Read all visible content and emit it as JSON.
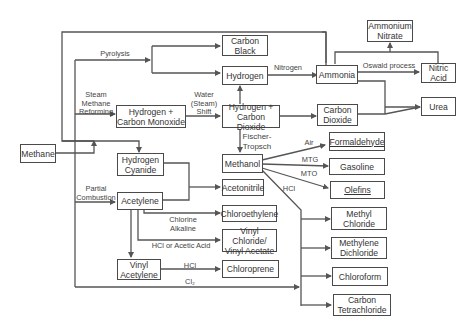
{
  "diagram": {
    "title": "",
    "nodes": {
      "methane": "Methane",
      "carbon_black": "Carbon\nBlack",
      "hydrogen": "Hydrogen",
      "h2_co": "Hydrogen +\nCarbon Monoxide",
      "h2_co2": "Hydrogen +\nCarbon Dioxide",
      "ammonia": "Ammonia",
      "ammonium_nitrate": "Ammonium\nNitrate",
      "nitric_acid": "Nitric\nAcid",
      "urea": "Urea",
      "carbon_dioxide": "Carbon\nDioxide",
      "hydrogen_cyanide": "Hydrogen\nCyanide",
      "methanol": "Methanol",
      "formaldehyde": "Formaldehyde",
      "gasoline": "Gasoline",
      "olefins": "Olefins",
      "acetonitrile": "Acetonitrile",
      "acetylene": "Acetylene",
      "chloroethylene": "Chloroethylene",
      "vinyl_chloride_acetate": "Vinyl Chloride/\nVinyl Acetate",
      "vinyl_acetylene": "Vinyl\nAcetylene",
      "chloroprene": "Chloroprene",
      "methyl_chloride": "Methyl\nChloride",
      "methylene_dichloride": "Methylene\nDichloride",
      "chloroform": "Chloroform",
      "carbon_tetrachloride": "Carbon\nTetrachloride"
    },
    "edge_labels": {
      "pyrolysis": "Pyrolysis",
      "steam_methane_reforming": "Steam\nMethane\nReforming",
      "water_steam_shift": "Water\n(Steam)\nShift",
      "nitrogen": "Nitrogen",
      "oswald_process": "Oswald process",
      "fischer_tropsch": "Fischer-\nTropsch",
      "air": "Air",
      "mtg": "MTG",
      "mto": "MTO",
      "hcl_methanol": "HCl",
      "partial_combustion": "Partial\nCombustion",
      "chlorine_alkaline": "Chlorine\nAlkaline",
      "hcl_or_acetic_acid": "HCl or Acetic Acid",
      "hcl_vinyl": "HCl",
      "cl2": "Cl₂"
    },
    "edges": [
      {
        "from": "methane",
        "to": "carbon_black",
        "label": "Pyrolysis"
      },
      {
        "from": "methane",
        "to": "hydrogen",
        "label": "Pyrolysis"
      },
      {
        "from": "methane",
        "to": "h2_co",
        "label": "Steam Methane Reforming"
      },
      {
        "from": "h2_co",
        "to": "h2_co2",
        "label": "Water (Steam) Shift"
      },
      {
        "from": "h2_co2",
        "to": "hydrogen"
      },
      {
        "from": "hydrogen",
        "to": "ammonia",
        "label": "Nitrogen"
      },
      {
        "from": "ammonia",
        "to": "nitric_acid",
        "label": "Oswald process"
      },
      {
        "from": "ammonia",
        "to": "ammonium_nitrate"
      },
      {
        "from": "nitric_acid",
        "to": "ammonium_nitrate"
      },
      {
        "from": "ammonia",
        "to": "urea"
      },
      {
        "from": "h2_co2",
        "to": "carbon_dioxide"
      },
      {
        "from": "carbon_dioxide",
        "to": "urea"
      },
      {
        "from": "ammonia",
        "to": "hydrogen_cyanide"
      },
      {
        "from": "methane",
        "to": "hydrogen_cyanide"
      },
      {
        "from": "h2_co2",
        "to": "methanol",
        "label": "Fischer-Tropsch"
      },
      {
        "from": "methanol",
        "to": "formaldehyde",
        "label": "Air"
      },
      {
        "from": "methanol",
        "to": "gasoline",
        "label": "MTG"
      },
      {
        "from": "methanol",
        "to": "olefins",
        "label": "MTO"
      },
      {
        "from": "methanol",
        "to": "methyl_chloride",
        "label": "HCl"
      },
      {
        "from": "methanol",
        "to": "methylene_dichloride",
        "label": "HCl"
      },
      {
        "from": "methanol",
        "to": "chloroform",
        "label": "HCl"
      },
      {
        "from": "methanol",
        "to": "carbon_tetrachloride",
        "label": "HCl"
      },
      {
        "from": "hydrogen_cyanide",
        "to": "acetonitrile"
      },
      {
        "from": "acetylene",
        "to": "acetonitrile"
      },
      {
        "from": "methane",
        "to": "acetylene",
        "label": "Partial Combustion"
      },
      {
        "from": "acetylene",
        "to": "chloroethylene",
        "label": "Chlorine Alkaline"
      },
      {
        "from": "acetylene",
        "to": "vinyl_chloride_acetate",
        "label": "HCl or Acetic Acid"
      },
      {
        "from": "acetylene",
        "to": "vinyl_acetylene"
      },
      {
        "from": "vinyl_acetylene",
        "to": "chloroprene",
        "label": "HCl"
      },
      {
        "from": "methane",
        "to": "chlorinated_methanes",
        "label": "Cl₂"
      }
    ]
  }
}
